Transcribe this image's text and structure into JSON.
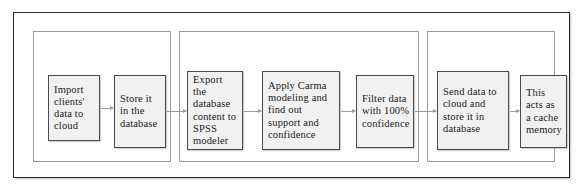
{
  "diagram": {
    "groups": [
      {
        "name": "group-ingest"
      },
      {
        "name": "group-analysis"
      },
      {
        "name": "group-cache"
      }
    ],
    "nodes": [
      {
        "id": "import-clients-data",
        "label": "Import\nclients'\ndata to\ncloud"
      },
      {
        "id": "store-in-database",
        "label": "Store it\nin the\ndatabase"
      },
      {
        "id": "export-to-spss",
        "label": "Export the\ndatabase\ncontent to\nSPSS\nmodeler"
      },
      {
        "id": "apply-carma-modeling",
        "label": "Apply Carma\nmodeling and\nfind out\nsupport and\nconfidence"
      },
      {
        "id": "filter-data",
        "label": "Filter data\nwith 100%\nconfidence"
      },
      {
        "id": "send-data-to-cloud",
        "label": "Send data to\ncloud and\nstore it in\ndatabase"
      },
      {
        "id": "cache-memory",
        "label": "This\nacts as\na cache\nmemory"
      }
    ],
    "arrows": [
      {
        "from": "import-clients-data",
        "to": "store-in-database"
      },
      {
        "from": "store-in-database",
        "to": "export-to-spss"
      },
      {
        "from": "export-to-spss",
        "to": "apply-carma-modeling"
      },
      {
        "from": "apply-carma-modeling",
        "to": "filter-data"
      },
      {
        "from": "filter-data",
        "to": "send-data-to-cloud"
      },
      {
        "from": "send-data-to-cloud",
        "to": "cache-memory"
      }
    ],
    "colors": {
      "node_fill": "#f1f1f1",
      "node_border": "#4a4a4a",
      "group_border": "#9a9a9a",
      "frame_border": "#2b2b2b",
      "arrow": "#9c9c9c",
      "text": "#1a1a1a",
      "background": "#ffffff"
    }
  }
}
